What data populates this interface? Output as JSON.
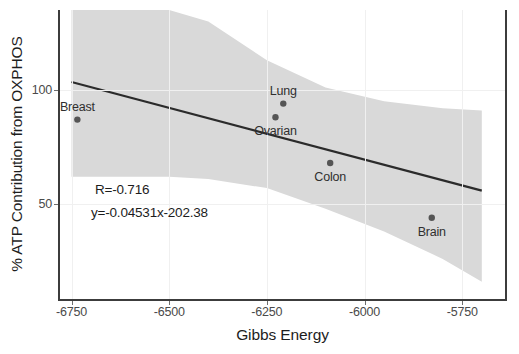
{
  "chart_data": {
    "type": "scatter",
    "title": "",
    "xlabel": "Gibbs Energy",
    "ylabel": "% ATP Contribution from OXPHOS",
    "xlim": [
      -6782,
      -5638
    ],
    "ylim": [
      8,
      135
    ],
    "grid": true,
    "legend": "none",
    "xticks": [
      -6750,
      -6500,
      -6250,
      -6000,
      -5750
    ],
    "xtick_labels": [
      "-6750",
      "-6500",
      "-6250",
      "-6000",
      "-5750"
    ],
    "yticks": [
      50,
      100
    ],
    "ytick_labels": [
      "50",
      "100"
    ],
    "points": [
      {
        "label": "Breast",
        "x": -6735,
        "y": 87,
        "label_dx": 0,
        "label_dy": -13
      },
      {
        "label": "Ovarian",
        "x": -6228,
        "y": 88,
        "label_dx": 0,
        "label_dy": 14
      },
      {
        "label": "Lung",
        "x": -6208,
        "y": 94,
        "label_dx": 0,
        "label_dy": -13
      },
      {
        "label": "Colon",
        "x": -6088,
        "y": 68,
        "label_dx": 0,
        "label_dy": 14
      },
      {
        "label": "Brain",
        "x": -5828,
        "y": 44,
        "label_dx": 0,
        "label_dy": 14
      }
    ],
    "fit_line": {
      "slope": -0.04531,
      "intercept": -202.38,
      "x_start": -6750,
      "x_end": -5700,
      "color": "#2b2b2b"
    },
    "confidence_band": {
      "color": "#d9d9d9",
      "upper": [
        {
          "x": -6750,
          "y": 135
        },
        {
          "x": -6500,
          "y": 135
        },
        {
          "x": -6400,
          "y": 130
        },
        {
          "x": -6250,
          "y": 113
        },
        {
          "x": -6100,
          "y": 101
        },
        {
          "x": -5950,
          "y": 95
        },
        {
          "x": -5800,
          "y": 92
        },
        {
          "x": -5700,
          "y": 91
        }
      ],
      "lower": [
        {
          "x": -6750,
          "y": 62
        },
        {
          "x": -6500,
          "y": 62
        },
        {
          "x": -6400,
          "y": 61
        },
        {
          "x": -6250,
          "y": 57
        },
        {
          "x": -6100,
          "y": 48
        },
        {
          "x": -5950,
          "y": 38
        },
        {
          "x": -5800,
          "y": 26
        },
        {
          "x": -5700,
          "y": 16
        }
      ]
    },
    "annotations": [
      {
        "text": "R=-0.716",
        "x": -6690,
        "y": 56
      },
      {
        "text": "y=-0.04531x-202.38",
        "x": -6700,
        "y": 46
      }
    ],
    "point_color": "#555555",
    "point_size": 3.2
  }
}
